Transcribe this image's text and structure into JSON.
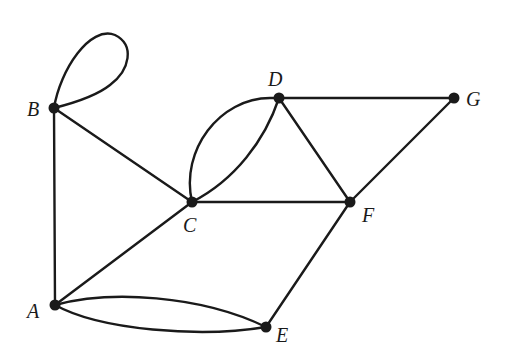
{
  "diagram": {
    "type": "undirected-multigraph",
    "colors": {
      "ink": "#1a1a1a",
      "background": "#ffffff"
    },
    "vertices": [
      {
        "id": "A",
        "label": "A",
        "x": 55,
        "y": 305,
        "label_x": 27,
        "label_y": 318
      },
      {
        "id": "B",
        "label": "B",
        "x": 54,
        "y": 108,
        "label_x": 27,
        "label_y": 116
      },
      {
        "id": "C",
        "label": "C",
        "x": 192,
        "y": 202,
        "label_x": 183,
        "label_y": 232
      },
      {
        "id": "D",
        "label": "D",
        "x": 279,
        "y": 98,
        "label_x": 268,
        "label_y": 86
      },
      {
        "id": "E",
        "label": "E",
        "x": 266,
        "y": 327,
        "label_x": 276,
        "label_y": 342
      },
      {
        "id": "F",
        "label": "F",
        "x": 350,
        "y": 202,
        "label_x": 362,
        "label_y": 222
      },
      {
        "id": "G",
        "label": "G",
        "x": 454,
        "y": 98,
        "label_x": 466,
        "label_y": 106
      }
    ],
    "edges": [
      {
        "from": "B",
        "to": "B",
        "kind": "loop"
      },
      {
        "from": "B",
        "to": "A",
        "kind": "straight"
      },
      {
        "from": "B",
        "to": "C",
        "kind": "straight"
      },
      {
        "from": "A",
        "to": "C",
        "kind": "straight"
      },
      {
        "from": "A",
        "to": "E",
        "kind": "curve-upper"
      },
      {
        "from": "A",
        "to": "E",
        "kind": "curve-lower"
      },
      {
        "from": "C",
        "to": "D",
        "kind": "curve-outer"
      },
      {
        "from": "C",
        "to": "D",
        "kind": "curve-inner"
      },
      {
        "from": "C",
        "to": "F",
        "kind": "straight"
      },
      {
        "from": "D",
        "to": "F",
        "kind": "straight"
      },
      {
        "from": "D",
        "to": "G",
        "kind": "straight"
      },
      {
        "from": "F",
        "to": "G",
        "kind": "straight"
      },
      {
        "from": "E",
        "to": "F",
        "kind": "straight"
      }
    ]
  }
}
